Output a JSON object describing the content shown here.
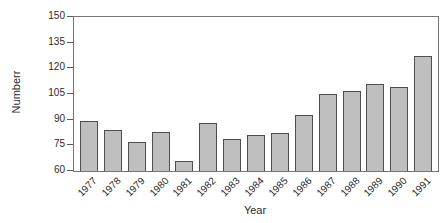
{
  "chart_data": {
    "type": "bar",
    "title": "",
    "xlabel": "Year",
    "ylabel": "Numberr",
    "categories": [
      "1977",
      "1978",
      "1979",
      "1980",
      "1981",
      "1982",
      "1983",
      "1984",
      "1985",
      "1986",
      "1987",
      "1988",
      "1989",
      "1990",
      "1991"
    ],
    "values": [
      89,
      84,
      77,
      83,
      66,
      88,
      79,
      81,
      82,
      93,
      105,
      107,
      111,
      109,
      127
    ],
    "ylim": [
      60,
      150
    ],
    "yticks": [
      60,
      75,
      90,
      105,
      120,
      135,
      150
    ],
    "xtick_rotation_deg": 45,
    "grid": false,
    "legend": null,
    "colors": {
      "bar_fill": "#bfbfbf",
      "bar_border": "#4f4f4f",
      "frame": "#767676",
      "text": "#2b2b2b",
      "background": "#ffffff"
    }
  }
}
